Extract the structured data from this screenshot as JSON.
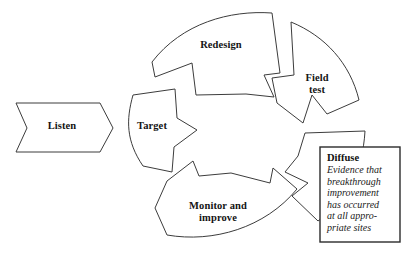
{
  "diagram": {
    "type": "cyclic-process-wheel",
    "stroke_color": "#3c3c3c",
    "fill_color": "#ffffff",
    "background_color": "#ffffff",
    "input": {
      "name": "listen-arrow",
      "label": "Listen",
      "shape": "chevron-arrow-right"
    },
    "wheel": {
      "center_label": "",
      "segments": [
        {
          "id": "target",
          "label": "Target",
          "position": "left"
        },
        {
          "id": "redesign",
          "label": "Redesign",
          "position": "top"
        },
        {
          "id": "fieldtest",
          "label": "Field\ntest",
          "position": "upper-right"
        },
        {
          "id": "diffuse",
          "label": "",
          "position": "lower-right"
        },
        {
          "id": "monitor",
          "label": "Monitor and\nimprove",
          "position": "bottom"
        }
      ]
    },
    "callout": {
      "name": "diffuse-callout",
      "title": "Diffuse",
      "body": "Evidence that\nbreakthrough\nimprovement\nhas occurred\nat all appro-\npriate sites"
    }
  }
}
